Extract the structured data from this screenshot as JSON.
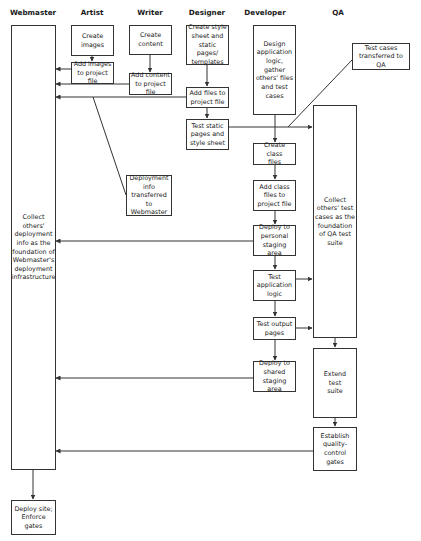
{
  "diagram": {
    "lanes": [
      {
        "id": "webmaster",
        "label": "Webmaster",
        "x": 33
      },
      {
        "id": "artist",
        "label": "Artist",
        "x": 92
      },
      {
        "id": "writer",
        "label": "Writer",
        "x": 150
      },
      {
        "id": "designer",
        "label": "Designer",
        "x": 207
      },
      {
        "id": "developer",
        "label": "Developer",
        "x": 265
      },
      {
        "id": "qa",
        "label": "QA",
        "x": 338
      }
    ],
    "nodes": {
      "wm_collect": "Collect\nothers'\ndeployment\ninfo as the\nfoundation of\nWebmaster's\ndeployment\ninfrastructure",
      "wm_deploy": "Deploy site;\nEnforce\ngates",
      "art_create": "Create\nimages",
      "art_add": "Add images\nto project file",
      "wri_create": "Create\ncontent",
      "wri_add": "Add content\nto project file",
      "des_create": "Create style\nsheet and\nstatic pages/\ntemplates",
      "des_add": "Add files to\nproject file",
      "des_test": "Test static\npages and\nstyle sheet",
      "deploy_info": "Deployment\ninfo\ntransferred\nto Webmaster",
      "dev_design": "Design\napplication\nlogic,\ngather\nothers' files\nand test\ncases",
      "dev_create": "Create class\nfiles",
      "dev_add": "Add class\nfiles to\nproject file",
      "dev_deploy_personal": "Deploy to\npersonal\nstaging area",
      "dev_test_logic": "Test\napplication\nlogic",
      "dev_test_output": "Test output\npages",
      "dev_deploy_shared": "Deploy to\nshared\nstaging area",
      "test_cases": "Test cases\ntransferred to QA",
      "qa_collect": "Collect\nothers' test\ncases as the\nfoundation\nof QA test\nsuite",
      "qa_extend": "Extend\ntest\nsuite",
      "qa_establish": "Establish\nquality-\ncontrol\ngates"
    },
    "colors": {
      "line": "#333333",
      "background": "#ffffff"
    }
  }
}
